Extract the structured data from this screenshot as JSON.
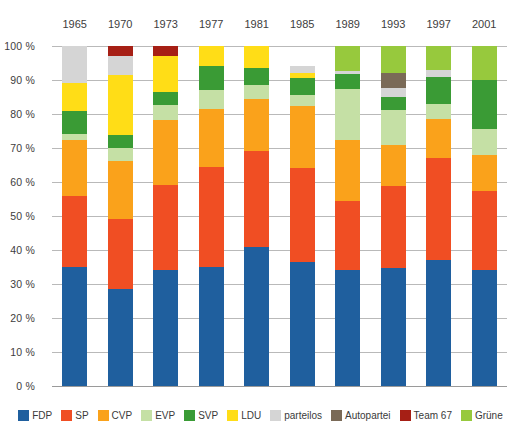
{
  "chart_data": {
    "type": "bar",
    "subtype": "stacked-percentage",
    "title": "",
    "xlabel": "",
    "ylabel": "",
    "ylim": [
      0,
      100
    ],
    "grid": true,
    "legend_position": "bottom",
    "categories": [
      "1965",
      "1970",
      "1973",
      "1977",
      "1981",
      "1985",
      "1989",
      "1993",
      "1997",
      "2001"
    ],
    "ytick_labels": [
      "0 %",
      "10 %",
      "20 %",
      "30 %",
      "40 %",
      "50 %",
      "60 %",
      "70 %",
      "80 %",
      "90 %",
      "100 %"
    ],
    "ytick_values": [
      0,
      10,
      20,
      30,
      40,
      50,
      60,
      70,
      80,
      90,
      100
    ],
    "series": [
      {
        "name": "FDP",
        "color": "#1f5f9e",
        "values": [
          35.0,
          30.0,
          35.0,
          35.0,
          41.0,
          36.5,
          35.0,
          35.0,
          37.0,
          34.0
        ]
      },
      {
        "name": "SP",
        "color": "#f04e23",
        "values": [
          21.0,
          21.5,
          26.0,
          29.5,
          28.0,
          27.5,
          21.0,
          24.5,
          30.0,
          23.5
        ]
      },
      {
        "name": "CVP",
        "color": "#faa21b",
        "values": [
          16.5,
          18.0,
          19.5,
          17.0,
          15.5,
          18.5,
          18.5,
          12.0,
          11.5,
          10.5
        ]
      },
      {
        "name": "EVP",
        "color": "#c5e0a5",
        "values": [
          1.5,
          4.0,
          4.5,
          5.5,
          4.0,
          3.0,
          15.5,
          10.5,
          4.5,
          7.5
        ]
      },
      {
        "name": "SVP",
        "color": "#3a9b35",
        "values": [
          7.0,
          4.0,
          4.0,
          7.0,
          5.0,
          5.0,
          4.5,
          4.0,
          8.0,
          14.5
        ]
      },
      {
        "name": "LDU",
        "color": "#ffdd17",
        "values": [
          8.0,
          18.5,
          11.0,
          6.0,
          6.5,
          1.5,
          0.0,
          0.0,
          0.0,
          0.0
        ]
      },
      {
        "name": "parteilos",
        "color": "#d5d5d5",
        "values": [
          11.0,
          6.0,
          0.0,
          0.0,
          0.0,
          2.0,
          1.0,
          2.5,
          2.0,
          0.0
        ]
      },
      {
        "name": "Autopartei",
        "color": "#7a6a57",
        "values": [
          0.0,
          0.0,
          0.0,
          0.0,
          0.0,
          0.0,
          0.0,
          4.5,
          0.0,
          0.0
        ]
      },
      {
        "name": "Team 67",
        "color": "#a61f15",
        "values": [
          0.0,
          3.0,
          3.0,
          0.0,
          0.0,
          0.0,
          0.0,
          0.0,
          0.0,
          0.0
        ]
      },
      {
        "name": "Grüne",
        "color": "#97c93d",
        "values": [
          0.0,
          0.0,
          0.0,
          0.0,
          0.0,
          0.0,
          7.5,
          8.0,
          7.0,
          10.0
        ]
      }
    ]
  },
  "legend": {
    "items": [
      {
        "label": "FDP",
        "color": "#1f5f9e"
      },
      {
        "label": "SP",
        "color": "#f04e23"
      },
      {
        "label": "CVP",
        "color": "#faa21b"
      },
      {
        "label": "EVP",
        "color": "#c5e0a5"
      },
      {
        "label": "SVP",
        "color": "#3a9b35"
      },
      {
        "label": "LDU",
        "color": "#ffdd17"
      },
      {
        "label": "parteilos",
        "color": "#d5d5d5"
      },
      {
        "label": "Autopartei",
        "color": "#7a6a57"
      },
      {
        "label": "Team 67",
        "color": "#a61f15"
      },
      {
        "label": "Grüne",
        "color": "#97c93d"
      }
    ]
  },
  "style": {
    "background": "#ffffff",
    "gridline_color": "#b9b9b9",
    "text_color": "#3d3d3d"
  }
}
